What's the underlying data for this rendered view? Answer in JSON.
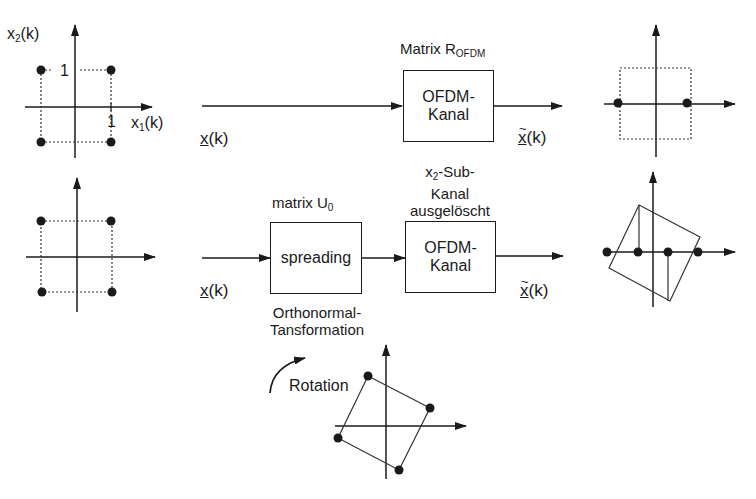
{
  "row1": {
    "constellation_in": {
      "y_axis_label": "x",
      "y_axis_sub": "2",
      "y_axis_arg": "(k)",
      "x_axis_label": "x",
      "x_axis_sub": "1",
      "x_axis_arg": "(k)",
      "tick_y": "1",
      "tick_x": "1"
    },
    "input_signal": "x",
    "input_arg": "(k)",
    "block_title_main": "Matrix R",
    "block_title_sub": "OFDM",
    "block_line1": "OFDM-",
    "block_line2": "Kanal",
    "output_signal": "x",
    "output_arg": "(k)"
  },
  "row2": {
    "input_signal": "x",
    "input_arg": "(k)",
    "spreading_title_main": "matrix U",
    "spreading_title_sub": "0",
    "spreading_label": "spreading",
    "spreading_caption_line1": "Orthonormal-",
    "spreading_caption_line2": "Tansformation",
    "channel_title_line1_main": "x",
    "channel_title_line1_sub": "2",
    "channel_title_line1_rest": "-Sub-",
    "channel_title_line2": "Kanal",
    "channel_title_line3": "ausgelöscht",
    "block_line1": "OFDM-",
    "block_line2": "Kanal",
    "output_signal": "x",
    "output_arg": "(k)"
  },
  "rotation": {
    "label": "Rotation"
  },
  "colors": {
    "line": "#1a1a1a",
    "dotted": "#333333",
    "background": "#ffffff"
  }
}
